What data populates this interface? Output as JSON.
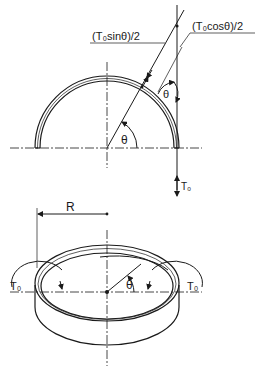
{
  "figure": {
    "top_view": {
      "label_sin": "(T₀sinθ)/2",
      "label_cos": "(T₀cosθ)/2",
      "angle_center": "θ",
      "angle_tangent": "θ",
      "force": "T₀"
    },
    "bottom_view": {
      "radius_label": "R",
      "angle": "θ",
      "torque_left": "T₀",
      "torque_right": "T₀"
    },
    "colors": {
      "ink": "#1a1a1a",
      "background": "#ffffff"
    }
  }
}
